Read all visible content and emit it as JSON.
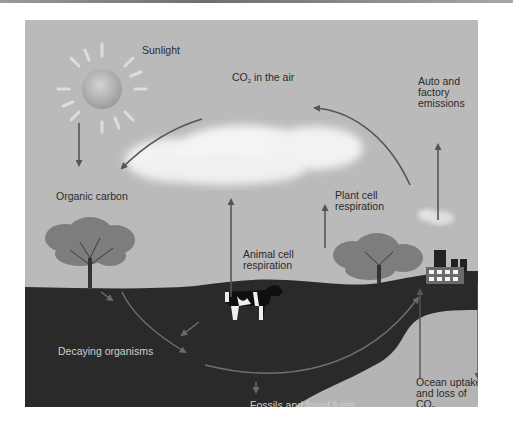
{
  "diagram": {
    "labels": {
      "sunlight": "Sunlight",
      "co2_air_prefix": "CO",
      "co2_air_sub": "2",
      "co2_air_suffix": " in the air",
      "auto_factory_line1": "Auto and",
      "auto_factory_line2": "factory",
      "auto_factory_line3": "emissions",
      "organic_carbon": "Organic carbon",
      "plant_resp_line1": "Plant cell",
      "plant_resp_line2": "respiration",
      "animal_resp_line1": "Animal cell",
      "animal_resp_line2": "respiration",
      "decaying": "Decaying organisms",
      "fossils": "Fossils and fossil fuels",
      "ocean_line1": "Ocean uptake",
      "ocean_line2": "and loss of",
      "ocean_line3_prefix": "CO",
      "ocean_line3_sub": "2"
    },
    "elements": [
      "sun-icon",
      "cloud-icon",
      "tree-icon",
      "tree-icon",
      "cow-icon",
      "factory-icon",
      "smoke-icon",
      "ground",
      "ocean"
    ],
    "colors": {
      "sky": "#bababa",
      "ground": "#2a2a2a",
      "ocean": "#b4b4b4",
      "arrow": "#555555",
      "cloud": "#f2f2f2"
    }
  }
}
